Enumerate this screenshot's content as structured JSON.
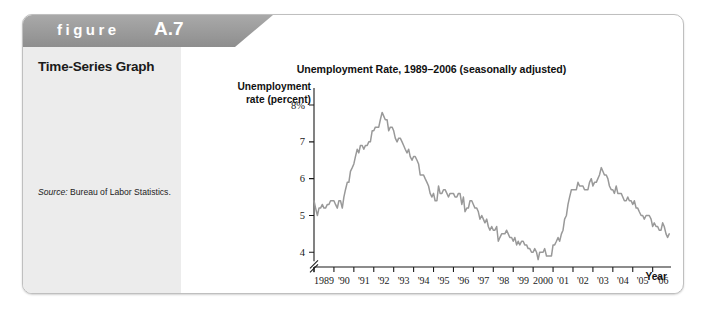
{
  "figure": {
    "label": "figure",
    "number": "A.7"
  },
  "caption": {
    "title": "Time-Series Graph",
    "body": "Time-series graphs show successive dates on the x-axis and values for a variable on the y-axis. This time-series graph shows the seasonally adjusted unemployment rate in the United States from 1989 to late 2006.",
    "source_label": "Source:",
    "source_text": "Bureau of Labor Statistics."
  },
  "chart_data": {
    "type": "line",
    "title": "Unemployment Rate, 1989–2006 (seasonally adjusted)",
    "xlabel": "Year",
    "ylabel": "Unemployment rate (percent)",
    "ylabel_line1": "Unemployment",
    "ylabel_line2": "rate (percent)",
    "ylim": [
      3.6,
      8.3
    ],
    "xlim": [
      1989.0,
      2006.92
    ],
    "grid": false,
    "legend": false,
    "axis_break": true,
    "line_color": "#999999",
    "axis_color": "#1a1a1a",
    "ytick_labels": [
      "8%",
      "7",
      "6",
      "5",
      "4"
    ],
    "ytick_values": [
      8,
      7,
      6,
      5,
      4
    ],
    "xtick_labels": [
      "1989",
      "'90",
      "'91",
      "'92",
      "'93",
      "'94",
      "'95",
      "'96",
      "'97",
      "'98",
      "'99",
      "2000",
      "'01",
      "'02",
      "'03",
      "'04",
      "'05",
      "'06"
    ],
    "xtick_values": [
      1989,
      1990,
      1991,
      1992,
      1993,
      1994,
      1995,
      1996,
      1997,
      1998,
      1999,
      2000,
      2001,
      2002,
      2003,
      2004,
      2005,
      2006
    ],
    "series": [
      {
        "name": "Unemployment rate (percent, seasonally adjusted)",
        "x": [
          1989.0,
          1989.08,
          1989.17,
          1989.25,
          1989.33,
          1989.42,
          1989.5,
          1989.58,
          1989.67,
          1989.75,
          1989.83,
          1989.92,
          1990.0,
          1990.08,
          1990.17,
          1990.25,
          1990.33,
          1990.42,
          1990.5,
          1990.58,
          1990.67,
          1990.75,
          1990.83,
          1990.92,
          1991.0,
          1991.08,
          1991.17,
          1991.25,
          1991.33,
          1991.42,
          1991.5,
          1991.58,
          1991.67,
          1991.75,
          1991.83,
          1991.92,
          1992.0,
          1992.08,
          1992.17,
          1992.25,
          1992.33,
          1992.42,
          1992.5,
          1992.58,
          1992.67,
          1992.75,
          1992.83,
          1992.92,
          1993.0,
          1993.08,
          1993.17,
          1993.25,
          1993.33,
          1993.42,
          1993.5,
          1993.58,
          1993.67,
          1993.75,
          1993.83,
          1993.92,
          1994.0,
          1994.08,
          1994.17,
          1994.25,
          1994.33,
          1994.42,
          1994.5,
          1994.58,
          1994.67,
          1994.75,
          1994.83,
          1994.92,
          1995.0,
          1995.08,
          1995.17,
          1995.25,
          1995.33,
          1995.42,
          1995.5,
          1995.58,
          1995.67,
          1995.75,
          1995.83,
          1995.92,
          1996.0,
          1996.08,
          1996.17,
          1996.25,
          1996.33,
          1996.42,
          1996.5,
          1996.58,
          1996.67,
          1996.75,
          1996.83,
          1996.92,
          1997.0,
          1997.08,
          1997.17,
          1997.25,
          1997.33,
          1997.42,
          1997.5,
          1997.58,
          1997.67,
          1997.75,
          1997.83,
          1997.92,
          1998.0,
          1998.08,
          1998.17,
          1998.25,
          1998.33,
          1998.42,
          1998.5,
          1998.58,
          1998.67,
          1998.75,
          1998.83,
          1998.92,
          1999.0,
          1999.08,
          1999.17,
          1999.25,
          1999.33,
          1999.42,
          1999.5,
          1999.58,
          1999.67,
          1999.75,
          1999.83,
          1999.92,
          2000.0,
          2000.08,
          2000.17,
          2000.25,
          2000.33,
          2000.42,
          2000.5,
          2000.58,
          2000.67,
          2000.75,
          2000.83,
          2000.92,
          2001.0,
          2001.08,
          2001.17,
          2001.25,
          2001.33,
          2001.42,
          2001.5,
          2001.58,
          2001.67,
          2001.75,
          2001.83,
          2001.92,
          2002.0,
          2002.08,
          2002.17,
          2002.25,
          2002.33,
          2002.42,
          2002.5,
          2002.58,
          2002.67,
          2002.75,
          2002.83,
          2002.92,
          2003.0,
          2003.08,
          2003.17,
          2003.25,
          2003.33,
          2003.42,
          2003.5,
          2003.58,
          2003.67,
          2003.75,
          2003.83,
          2003.92,
          2004.0,
          2004.08,
          2004.17,
          2004.25,
          2004.33,
          2004.42,
          2004.5,
          2004.58,
          2004.67,
          2004.75,
          2004.83,
          2004.92,
          2005.0,
          2005.08,
          2005.17,
          2005.25,
          2005.33,
          2005.42,
          2005.5,
          2005.58,
          2005.67,
          2005.75,
          2005.83,
          2005.92,
          2006.0,
          2006.08,
          2006.17,
          2006.25,
          2006.33,
          2006.42,
          2006.5,
          2006.58,
          2006.67,
          2006.75,
          2006.83
        ],
        "y": [
          5.4,
          5.2,
          5.0,
          5.2,
          5.2,
          5.3,
          5.2,
          5.2,
          5.3,
          5.3,
          5.4,
          5.4,
          5.4,
          5.3,
          5.2,
          5.4,
          5.4,
          5.2,
          5.5,
          5.7,
          5.9,
          5.9,
          6.2,
          6.3,
          6.4,
          6.6,
          6.8,
          6.7,
          6.9,
          6.9,
          6.8,
          6.9,
          6.9,
          7.0,
          7.0,
          7.3,
          7.3,
          7.4,
          7.4,
          7.4,
          7.6,
          7.8,
          7.7,
          7.6,
          7.6,
          7.3,
          7.4,
          7.4,
          7.3,
          7.1,
          7.0,
          7.1,
          7.1,
          7.0,
          6.9,
          6.8,
          6.7,
          6.8,
          6.6,
          6.5,
          6.6,
          6.6,
          6.5,
          6.4,
          6.1,
          6.1,
          6.1,
          6.0,
          5.9,
          5.8,
          5.6,
          5.5,
          5.6,
          5.4,
          5.4,
          5.8,
          5.6,
          5.6,
          5.7,
          5.7,
          5.6,
          5.5,
          5.6,
          5.6,
          5.6,
          5.5,
          5.5,
          5.6,
          5.6,
          5.3,
          5.5,
          5.1,
          5.2,
          5.2,
          5.4,
          5.4,
          5.3,
          5.2,
          5.2,
          5.1,
          4.9,
          5.0,
          4.9,
          4.8,
          4.9,
          4.7,
          4.6,
          4.7,
          4.6,
          4.6,
          4.7,
          4.3,
          4.4,
          4.5,
          4.5,
          4.5,
          4.6,
          4.5,
          4.4,
          4.4,
          4.3,
          4.4,
          4.2,
          4.3,
          4.2,
          4.3,
          4.3,
          4.2,
          4.2,
          4.1,
          4.1,
          4.0,
          4.0,
          4.1,
          4.0,
          3.8,
          4.0,
          4.0,
          4.0,
          4.1,
          3.9,
          3.9,
          3.9,
          3.9,
          4.2,
          4.2,
          4.3,
          4.4,
          4.3,
          4.5,
          4.6,
          4.9,
          5.0,
          5.3,
          5.5,
          5.7,
          5.7,
          5.7,
          5.7,
          5.9,
          5.8,
          5.8,
          5.8,
          5.7,
          5.7,
          5.7,
          5.9,
          6.0,
          5.8,
          5.9,
          5.9,
          6.0,
          6.1,
          6.3,
          6.2,
          6.1,
          6.1,
          6.0,
          5.8,
          5.7,
          5.7,
          5.6,
          5.8,
          5.6,
          5.6,
          5.6,
          5.5,
          5.4,
          5.4,
          5.5,
          5.4,
          5.4,
          5.3,
          5.4,
          5.2,
          5.2,
          5.1,
          5.0,
          5.0,
          4.9,
          5.0,
          5.0,
          5.0,
          4.9,
          4.7,
          4.8,
          4.7,
          4.7,
          4.6,
          4.6,
          4.8,
          4.7,
          4.5,
          4.4,
          4.5
        ]
      }
    ]
  }
}
